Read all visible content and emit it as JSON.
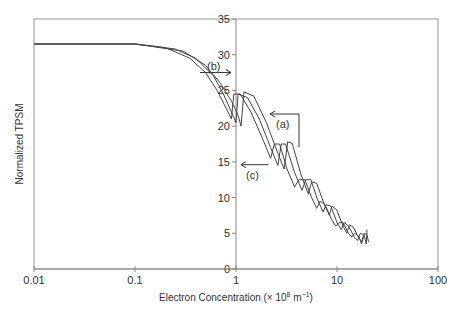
{
  "chart_data": {
    "type": "line",
    "title": "",
    "xlabel": "Electron Concentration (× 10⁸ m⁻¹)",
    "xlabel_main": "Electron Concentration (× 10",
    "xlabel_sup1": "8",
    "xlabel_mid": " m",
    "xlabel_sup2": "−1",
    "xlabel_end": ")",
    "ylabel": "Normalized TPSM",
    "xscale": "log",
    "xlim": [
      0.01,
      100
    ],
    "ylim": [
      0,
      35
    ],
    "x_ticks": [
      "0.01",
      "0.1",
      "1",
      "10",
      "100"
    ],
    "y_ticks": [
      "0",
      "5",
      "10",
      "15",
      "20",
      "25",
      "30",
      "35"
    ],
    "grid": false,
    "legend": null,
    "annotations": [
      {
        "label": "(a)",
        "x": 3.3,
        "y": 21.5,
        "arrow": "left"
      },
      {
        "label": "(b)",
        "x": 0.75,
        "y": 27.5,
        "arrow": "right"
      },
      {
        "label": "(c)",
        "x": 1.3,
        "y": 14.5,
        "arrow": "left"
      }
    ],
    "series": [
      {
        "name": "(a)",
        "points": [
          [
            0.01,
            31.5
          ],
          [
            0.1,
            31.5
          ],
          [
            0.2,
            31.0
          ],
          [
            0.35,
            29.5
          ],
          [
            0.5,
            27.5
          ],
          [
            0.65,
            25
          ],
          [
            0.8,
            22.5
          ],
          [
            0.9,
            21
          ],
          [
            0.95,
            24.5
          ],
          [
            1.1,
            24.5
          ],
          [
            1.4,
            22
          ],
          [
            1.8,
            18.5
          ],
          [
            2.2,
            15.5
          ],
          [
            2.4,
            17.5
          ],
          [
            2.7,
            17.5
          ],
          [
            3.2,
            14
          ],
          [
            3.8,
            11.5
          ],
          [
            4.2,
            12.5
          ],
          [
            4.8,
            12.5
          ],
          [
            5.6,
            10
          ],
          [
            6.3,
            8.5
          ],
          [
            6.8,
            9.5
          ],
          [
            7.6,
            9
          ],
          [
            8.8,
            7
          ],
          [
            9.7,
            6
          ],
          [
            10.5,
            6.5
          ],
          [
            11.5,
            6.5
          ],
          [
            13,
            5
          ],
          [
            14,
            4.5
          ],
          [
            15,
            5
          ],
          [
            16.5,
            4.5
          ],
          [
            17.5,
            3.5
          ],
          [
            18,
            4.5
          ]
        ]
      },
      {
        "name": "(b)",
        "points": [
          [
            0.01,
            31.5
          ],
          [
            0.1,
            31.5
          ],
          [
            0.25,
            30.8
          ],
          [
            0.4,
            29.5
          ],
          [
            0.6,
            27
          ],
          [
            0.75,
            24.5
          ],
          [
            0.9,
            22
          ],
          [
            1.0,
            20.5
          ],
          [
            1.05,
            24.5
          ],
          [
            1.3,
            24
          ],
          [
            1.7,
            21
          ],
          [
            2.2,
            17
          ],
          [
            2.6,
            14.5
          ],
          [
            2.8,
            17.5
          ],
          [
            3.1,
            17.5
          ],
          [
            3.8,
            13.5
          ],
          [
            4.5,
            11
          ],
          [
            4.9,
            12.5
          ],
          [
            5.5,
            12.5
          ],
          [
            6.5,
            9.5
          ],
          [
            7.3,
            8
          ],
          [
            7.8,
            9
          ],
          [
            8.7,
            8.8
          ],
          [
            10,
            6.5
          ],
          [
            11,
            5.5
          ],
          [
            11.8,
            6.5
          ],
          [
            13,
            6
          ],
          [
            14.8,
            4.5
          ],
          [
            16,
            4
          ],
          [
            17,
            5
          ],
          [
            18.5,
            4.8
          ],
          [
            19.5,
            3.5
          ],
          [
            19.8,
            5.5
          ]
        ]
      },
      {
        "name": "(c)",
        "points": [
          [
            0.01,
            31.5
          ],
          [
            0.1,
            31.5
          ],
          [
            0.3,
            30.5
          ],
          [
            0.5,
            28.5
          ],
          [
            0.7,
            26
          ],
          [
            0.9,
            23.5
          ],
          [
            1.05,
            21.5
          ],
          [
            1.12,
            20
          ],
          [
            1.2,
            24.8
          ],
          [
            1.5,
            24.2
          ],
          [
            2.0,
            20.5
          ],
          [
            2.6,
            16.2
          ],
          [
            3.0,
            14
          ],
          [
            3.25,
            17.8
          ],
          [
            3.6,
            17.6
          ],
          [
            4.4,
            13.2
          ],
          [
            5.2,
            10.5
          ],
          [
            5.6,
            12.2
          ],
          [
            6.3,
            12
          ],
          [
            7.5,
            9
          ],
          [
            8.4,
            7.5
          ],
          [
            8.9,
            8.8
          ],
          [
            9.9,
            8.3
          ],
          [
            11.5,
            6
          ],
          [
            12.5,
            5
          ],
          [
            13.3,
            6.2
          ],
          [
            14.6,
            5.8
          ],
          [
            16.5,
            4.3
          ],
          [
            17.8,
            3.8
          ],
          [
            18.6,
            5
          ],
          [
            19.8,
            4.8
          ],
          [
            20.5,
            3.8
          ]
        ]
      }
    ]
  }
}
